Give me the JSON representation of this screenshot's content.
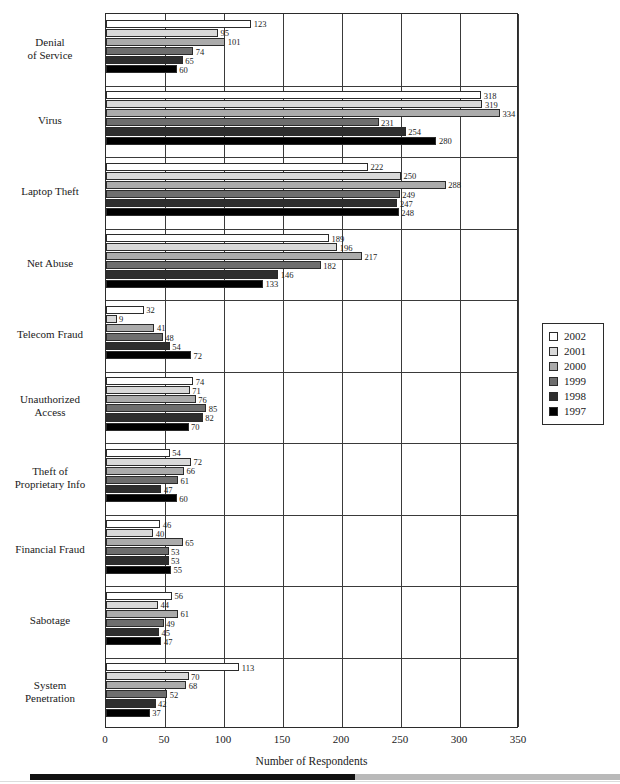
{
  "chart_data": {
    "type": "bar",
    "orientation": "horizontal",
    "title": "",
    "xlabel": "Number of Respondents",
    "ylabel": "",
    "xlim": [
      0,
      350
    ],
    "xticks": [
      0,
      50,
      100,
      150,
      200,
      250,
      300,
      350
    ],
    "grid": true,
    "legend_position": "right",
    "categories": [
      "Denial\nof Service",
      "Virus",
      "Laptop Theft",
      "Net Abuse",
      "Telecom Fraud",
      "Unauthorized\nAccess",
      "Theft of\nProprietary Info",
      "Financial Fraud",
      "Sabotage",
      "System\nPenetration"
    ],
    "category_labels": [
      [
        "Denial",
        "of Service"
      ],
      [
        "Virus"
      ],
      [
        "Laptop Theft"
      ],
      [
        "Net Abuse"
      ],
      [
        "Telecom Fraud"
      ],
      [
        "Unauthorized",
        "Access"
      ],
      [
        "Theft of",
        "Proprietary Info"
      ],
      [
        "Financial Fraud"
      ],
      [
        "Sabotage"
      ],
      [
        "System",
        "Penetration"
      ]
    ],
    "series": [
      {
        "name": "2002",
        "color": "#ffffff",
        "values": [
          123,
          318,
          222,
          189,
          32,
          74,
          54,
          46,
          56,
          113
        ]
      },
      {
        "name": "2001",
        "color": "#d9d9d9",
        "values": [
          95,
          319,
          250,
          196,
          9,
          71,
          72,
          40,
          44,
          70
        ]
      },
      {
        "name": "2000",
        "color": "#ababab",
        "values": [
          101,
          334,
          288,
          217,
          41,
          76,
          66,
          65,
          61,
          68
        ]
      },
      {
        "name": "1999",
        "color": "#6e6e6e",
        "values": [
          74,
          231,
          249,
          182,
          48,
          85,
          61,
          53,
          49,
          52
        ]
      },
      {
        "name": "1998",
        "color": "#2e2e2e",
        "values": [
          65,
          254,
          247,
          146,
          54,
          82,
          47,
          53,
          45,
          42
        ]
      },
      {
        "name": "1997",
        "color": "#000000",
        "values": [
          60,
          280,
          248,
          133,
          72,
          70,
          60,
          55,
          47,
          37
        ]
      }
    ]
  },
  "legend": {
    "entries": [
      {
        "label": "2002",
        "color": "#ffffff"
      },
      {
        "label": "2001",
        "color": "#d9d9d9"
      },
      {
        "label": "2000",
        "color": "#ababab"
      },
      {
        "label": "1999",
        "color": "#6e6e6e"
      },
      {
        "label": "1998",
        "color": "#2e2e2e"
      },
      {
        "label": "1997",
        "color": "#000000"
      }
    ]
  },
  "axis": {
    "x_title": "Number of Respondents",
    "x_tick_labels": [
      "0",
      "50",
      "100",
      "150",
      "200",
      "250",
      "300",
      "350"
    ]
  }
}
